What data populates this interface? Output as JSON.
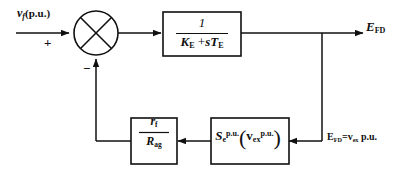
{
  "diagram": {
    "type": "control-block-diagram",
    "background_color": "#ffffff",
    "line_color": "#101010",
    "input": {
      "label_var": "v",
      "label_sub": "f",
      "label_unit": "(p.u.)",
      "sign": "+"
    },
    "summing_junction": {
      "name": "summing-junction",
      "style": "circle-with-cross",
      "positive_input_sign": "+",
      "negative_input_sign": "−"
    },
    "transfer_block": {
      "numerator": "1",
      "denominator_first": "K",
      "denominator_first_sub": "E",
      "denominator_operator": "+",
      "denominator_second": "sT",
      "denominator_second_sub": "E",
      "denominator_plain": "K_E + sT_E"
    },
    "output": {
      "label_main": "E",
      "label_sub": "FD"
    },
    "gain_block": {
      "numerator_main": "r",
      "numerator_sub": "f",
      "denominator_main": "R",
      "denominator_sub": "ag",
      "plain": "r_f / R_ag"
    },
    "saturation_block": {
      "function_main": "S",
      "function_sub": "e",
      "function_sup": "p.u.",
      "arg_main": "v",
      "arg_sub": "ex",
      "arg_sup": "p.u.",
      "open_paren": "(",
      "close_paren": ")",
      "plain": "S_e^p.u.(v_ex^p.u.)"
    },
    "feedback_note": {
      "main": "E",
      "main_sub": "FD",
      "equals": "=",
      "var_main": "v",
      "var_sub": "ex",
      "unit": " p.u."
    }
  }
}
